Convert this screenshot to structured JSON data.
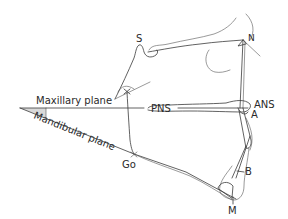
{
  "diagram": {
    "type": "cephalometric-tracing",
    "colors": {
      "line": "#3a3a3a",
      "text": "#2a2a2a",
      "angle_fill": "#d9d9d9",
      "background": "#ffffff"
    },
    "landmarks": {
      "S": "S",
      "N": "N",
      "PNS": "PNS",
      "ANS": "ANS",
      "A": "A",
      "B": "B",
      "M": "M",
      "Go": "Go"
    },
    "planes": {
      "maxillary": "Maxillary plane",
      "mandibular": "Mandibular plane"
    }
  }
}
